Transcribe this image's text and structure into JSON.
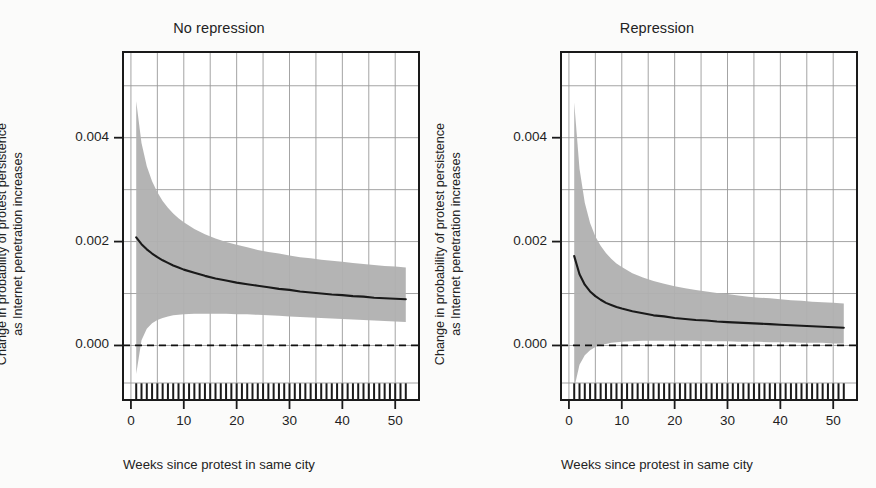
{
  "figure": {
    "background": "#fbfbfa",
    "ink": "#232323",
    "band_color": "#b0b0b0",
    "grid_color": "#9a9a9a",
    "line_color": "#1a1a1a"
  },
  "chart_data": {
    "type": "line",
    "title": "",
    "panels": [
      {
        "id": "no-repression",
        "title": "No repression",
        "xlabel": "Weeks since protest in same city",
        "ylabel_lines": [
          "Change in probability of protest persistence",
          "as Internet penetration increases"
        ],
        "xlim": [
          -1.5,
          54.5
        ],
        "ylim": [
          -0.00105,
          0.00565
        ],
        "xticks": [
          0,
          10,
          20,
          30,
          40,
          50
        ],
        "xtick_labels": [
          "0",
          "10",
          "20",
          "30",
          "40",
          "50"
        ],
        "yticks": [
          0.0,
          0.002,
          0.004
        ],
        "ytick_labels": [
          "0.000",
          "0.002",
          "0.004"
        ],
        "gridlines_y": [
          0.0,
          0.001,
          0.002,
          0.003,
          0.004,
          0.005
        ],
        "gridlines_x": [
          0,
          5,
          10,
          15,
          20,
          25,
          30,
          35,
          40,
          45,
          50
        ],
        "grid": true,
        "zero_reference_line": 0.0,
        "zero_line_style": "dashed",
        "rug": true,
        "x": [
          1,
          2,
          3,
          4,
          5,
          6,
          7,
          8,
          9,
          10,
          12,
          14,
          16,
          18,
          20,
          22,
          24,
          26,
          28,
          30,
          32,
          34,
          36,
          38,
          40,
          42,
          44,
          46,
          48,
          50,
          52
        ],
        "series": [
          {
            "name": "estimate",
            "values": [
              0.00208,
              0.00195,
              0.00185,
              0.00177,
              0.0017,
              0.00164,
              0.00159,
              0.00154,
              0.0015,
              0.00146,
              0.0014,
              0.00134,
              0.00129,
              0.00125,
              0.00121,
              0.00118,
              0.00115,
              0.00112,
              0.00109,
              0.00107,
              0.00104,
              0.00102,
              0.001,
              0.00098,
              0.00097,
              0.00095,
              0.00094,
              0.00092,
              0.00091,
              0.0009,
              0.00089
            ]
          },
          {
            "name": "ci_upper",
            "values": [
              0.0047,
              0.0039,
              0.00345,
              0.00316,
              0.00295,
              0.00278,
              0.00265,
              0.00254,
              0.00245,
              0.00237,
              0.00224,
              0.00214,
              0.00206,
              0.00199,
              0.00194,
              0.00189,
              0.00184,
              0.0018,
              0.00177,
              0.00173,
              0.0017,
              0.00168,
              0.00165,
              0.00163,
              0.00161,
              0.00159,
              0.00157,
              0.00155,
              0.00153,
              0.00152,
              0.0015
            ]
          },
          {
            "name": "ci_lower",
            "values": [
              -0.00055,
              0.0001,
              0.00032,
              0.00043,
              0.00049,
              0.00053,
              0.00056,
              0.00058,
              0.00059,
              0.0006,
              0.00061,
              0.00061,
              0.00061,
              0.00061,
              0.0006,
              0.0006,
              0.00059,
              0.00058,
              0.00057,
              0.00056,
              0.00055,
              0.00054,
              0.00053,
              0.00052,
              0.00051,
              0.0005,
              0.00049,
              0.00048,
              0.00047,
              0.00046,
              0.00045
            ]
          }
        ]
      },
      {
        "id": "repression",
        "title": "Repression",
        "xlabel": "Weeks since protest in same city",
        "ylabel_lines": [
          "Change in probability of protest persistence",
          "as Internet penetration increases"
        ],
        "xlim": [
          -1.5,
          54.5
        ],
        "ylim": [
          -0.00105,
          0.00565
        ],
        "xticks": [
          0,
          10,
          20,
          30,
          40,
          50
        ],
        "xtick_labels": [
          "0",
          "10",
          "20",
          "30",
          "40",
          "50"
        ],
        "yticks": [
          0.0,
          0.002,
          0.004
        ],
        "ytick_labels": [
          "0.000",
          "0.002",
          "0.004"
        ],
        "gridlines_y": [
          0.0,
          0.001,
          0.002,
          0.003,
          0.004,
          0.005
        ],
        "gridlines_x": [
          0,
          5,
          10,
          15,
          20,
          25,
          30,
          35,
          40,
          45,
          50
        ],
        "grid": true,
        "zero_reference_line": 0.0,
        "zero_line_style": "dashed",
        "rug": true,
        "x": [
          1,
          2,
          3,
          4,
          5,
          6,
          7,
          8,
          9,
          10,
          12,
          14,
          16,
          18,
          20,
          22,
          24,
          26,
          28,
          30,
          32,
          34,
          36,
          38,
          40,
          42,
          44,
          46,
          48,
          50,
          52
        ],
        "series": [
          {
            "name": "estimate",
            "values": [
              0.00172,
              0.00137,
              0.00117,
              0.00104,
              0.00095,
              0.00088,
              0.00082,
              0.00078,
              0.00074,
              0.00071,
              0.00066,
              0.00062,
              0.00058,
              0.00056,
              0.00053,
              0.00051,
              0.00049,
              0.00048,
              0.00046,
              0.00045,
              0.00044,
              0.00043,
              0.00042,
              0.00041,
              0.0004,
              0.00039,
              0.00038,
              0.00037,
              0.00036,
              0.00035,
              0.00034
            ]
          },
          {
            "name": "ci_upper",
            "values": [
              0.00468,
              0.0034,
              0.00275,
              0.00236,
              0.0021,
              0.00192,
              0.00178,
              0.00167,
              0.00158,
              0.00151,
              0.00139,
              0.00131,
              0.00124,
              0.00119,
              0.00114,
              0.0011,
              0.00107,
              0.00104,
              0.00101,
              0.00099,
              0.00096,
              0.00094,
              0.00092,
              0.00091,
              0.00089,
              0.00087,
              0.00086,
              0.00084,
              0.00083,
              0.00082,
              0.00081
            ]
          },
          {
            "name": "ci_lower",
            "values": [
              -0.00082,
              -0.00037,
              -0.00019,
              -9e-05,
              -3e-05,
              1e-05,
              3e-05,
              5e-05,
              6e-05,
              7e-05,
              8e-05,
              9e-05,
              9e-05,
              9e-05,
              9e-05,
              9e-05,
              9e-05,
              8e-05,
              8e-05,
              8e-05,
              7e-05,
              7e-05,
              7e-05,
              6e-05,
              6e-05,
              6e-05,
              5e-05,
              5e-05,
              5e-05,
              4e-05,
              4e-05
            ]
          }
        ]
      }
    ]
  }
}
